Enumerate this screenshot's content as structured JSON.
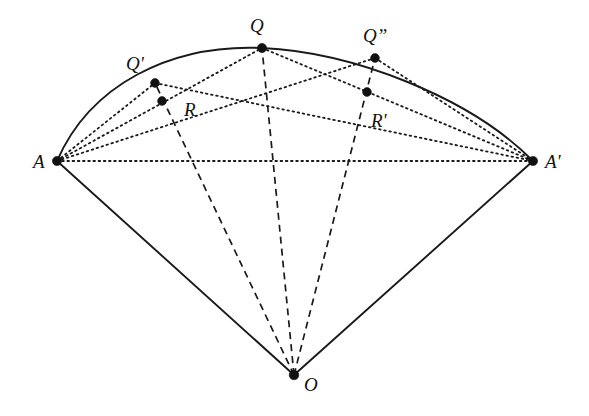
{
  "figure": {
    "type": "geometry-diagram",
    "canvas": {
      "width": 589,
      "height": 416
    },
    "background_color": "#ffffff",
    "stroke_color": "#1a1a1a"
  },
  "points": [
    {
      "id": "A",
      "label": "A",
      "prime": "",
      "x": 57,
      "y": 161,
      "label_x": 33,
      "label_y": 152,
      "dot_r": 4.6
    },
    {
      "id": "Aprime",
      "label": "A",
      "prime": "'",
      "x": 533,
      "y": 161,
      "label_x": 545,
      "label_y": 152,
      "dot_r": 4.6
    },
    {
      "id": "Q",
      "label": "Q",
      "prime": "",
      "x": 262,
      "y": 48,
      "label_x": 250,
      "label_y": 16,
      "dot_r": 4.6
    },
    {
      "id": "Qprime",
      "label": "Q",
      "prime": "'",
      "x": 155,
      "y": 83,
      "label_x": 126,
      "label_y": 54,
      "dot_r": 4.4
    },
    {
      "id": "Qdprime",
      "label": "Q",
      "prime": "”",
      "x": 375,
      "y": 58,
      "label_x": 363,
      "label_y": 26,
      "dot_r": 4.4
    },
    {
      "id": "R",
      "label": "R",
      "prime": "",
      "x": 162,
      "y": 101,
      "label_x": 184,
      "label_y": 100,
      "dot_r": 4.4
    },
    {
      "id": "Rprime",
      "label": "R",
      "prime": "'",
      "x": 367,
      "y": 92,
      "label_x": 371,
      "label_y": 111,
      "dot_r": 4.4
    },
    {
      "id": "O",
      "label": "O",
      "prime": "",
      "x": 294,
      "y": 375,
      "label_x": 304,
      "label_y": 375,
      "dot_r": 4.8
    }
  ],
  "arc": {
    "name": "arc-A-to-Aprime",
    "style": "solid",
    "path": "M 57 161 C 90 85, 170 44, 262 48 C 352 52, 470 97, 533 161"
  },
  "segments": [
    {
      "name": "radius-O-A",
      "style": "solid",
      "from": "O",
      "to": "A",
      "x1": 294,
      "y1": 375,
      "x2": 57,
      "y2": 161
    },
    {
      "name": "radius-O-Aprime",
      "style": "solid",
      "from": "O",
      "to": "Aprime",
      "x1": 294,
      "y1": 375,
      "x2": 533,
      "y2": 161
    },
    {
      "name": "radius-O-Qprime",
      "style": "dashed",
      "from": "O",
      "to": "Qprime",
      "x1": 294,
      "y1": 375,
      "x2": 155,
      "y2": 83
    },
    {
      "name": "radius-O-Q",
      "style": "dashed",
      "from": "O",
      "to": "Q",
      "x1": 294,
      "y1": 375,
      "x2": 262,
      "y2": 48
    },
    {
      "name": "radius-O-Qdprime",
      "style": "dashed",
      "from": "O",
      "to": "Qdprime",
      "x1": 294,
      "y1": 375,
      "x2": 375,
      "y2": 58
    },
    {
      "name": "chord-A-Aprime",
      "style": "dotted",
      "from": "A",
      "to": "Aprime",
      "x1": 57,
      "y1": 161,
      "x2": 533,
      "y2": 161
    },
    {
      "name": "chord-A-Qprime",
      "style": "dotted",
      "from": "A",
      "to": "Qprime",
      "x1": 57,
      "y1": 161,
      "x2": 155,
      "y2": 83
    },
    {
      "name": "chord-A-Q",
      "style": "dotted",
      "from": "A",
      "to": "Q",
      "x1": 57,
      "y1": 161,
      "x2": 262,
      "y2": 48
    },
    {
      "name": "chord-A-Qdprime",
      "style": "dotted",
      "from": "A",
      "to": "Qdprime",
      "x1": 57,
      "y1": 161,
      "x2": 375,
      "y2": 58
    },
    {
      "name": "chord-Qprime-Aprime",
      "style": "dotted",
      "from": "Qprime",
      "to": "Aprime",
      "x1": 155,
      "y1": 83,
      "x2": 533,
      "y2": 161
    },
    {
      "name": "chord-Q-Aprime",
      "style": "dotted",
      "from": "Q",
      "to": "Aprime",
      "x1": 262,
      "y1": 48,
      "x2": 533,
      "y2": 161
    },
    {
      "name": "chord-Qdprime-Aprime",
      "style": "dotted",
      "from": "Qdprime",
      "to": "Aprime",
      "x1": 375,
      "y1": 58,
      "x2": 533,
      "y2": 161
    }
  ]
}
